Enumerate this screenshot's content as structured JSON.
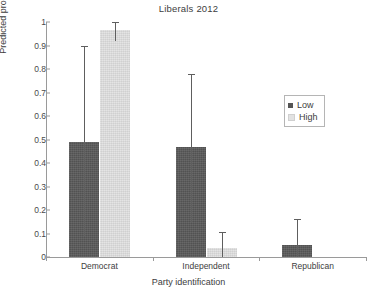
{
  "chart_data": {
    "type": "bar",
    "title": "Liberals 2012",
    "xlabel": "Party identification",
    "ylabel": "Predicted probability",
    "categories": [
      "Democrat",
      "Independent",
      "Republican"
    ],
    "ylim": [
      0,
      1
    ],
    "yticks": [
      "0",
      "0.1",
      "0.2",
      "0.3",
      "0.4",
      "0.5",
      "0.6",
      "0.7",
      "0.8",
      "0.9",
      "1"
    ],
    "ytick_values": [
      0,
      0.1,
      0.2,
      0.3,
      0.4,
      0.5,
      0.6,
      0.7,
      0.8,
      0.9,
      1
    ],
    "grid": false,
    "legend_position": "right",
    "series": [
      {
        "name": "Low",
        "color": "#595959",
        "values": [
          0.49,
          0.47,
          0.05
        ],
        "error_low": [
          0.085,
          0.15,
          0.0
        ],
        "error_high": [
          0.9,
          0.78,
          0.16
        ]
      },
      {
        "name": "High",
        "color": "#e2e2e2",
        "values": [
          0.965,
          0.04,
          0.0
        ],
        "error_low": [
          0.92,
          0.0,
          0.0
        ],
        "error_high": [
          1.0,
          0.105,
          0.0
        ]
      }
    ]
  },
  "legend": {
    "items": [
      {
        "label": "Low"
      },
      {
        "label": "High"
      }
    ]
  }
}
